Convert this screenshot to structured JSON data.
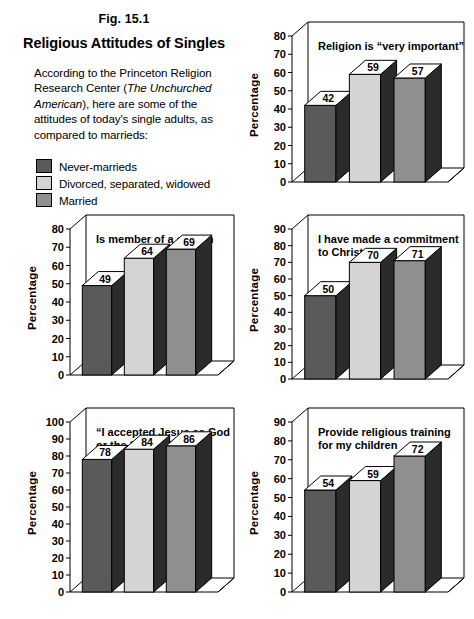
{
  "figure": {
    "fig_label": "Fig. 15.1",
    "title": "Religious Attitudes of Singles",
    "body_part1": "According to the Princeton Religion Research Center (",
    "body_italic1": "The Unchurched American",
    "body_part2": "), here are some of the attitudes of today's single adults, as compared to marrieds:"
  },
  "legend": {
    "items": [
      {
        "label": "Never-marrieds",
        "color": "#5a5a5a"
      },
      {
        "label": "Divorced, separated, widowed",
        "color": "#d4d4d4"
      },
      {
        "label": "Married",
        "color": "#8f8f8f"
      }
    ]
  },
  "axis_label": "Percentage",
  "colors": {
    "series_never_married": "#5a5a5a",
    "series_divorced": "#d4d4d4",
    "series_married": "#8f8f8f",
    "bar_side_shadow": "#2b2b2b",
    "bar_top_face": "#ffffff",
    "frame_line": "#000000",
    "background": "#ffffff"
  },
  "chart_data": [
    {
      "id": "religion-very-important",
      "type": "bar",
      "title": "Religion is \"very important\"",
      "title_lines": [
        "Religion is “very important”"
      ],
      "ylabel": "Percentage",
      "xlabel": "",
      "categories": [
        "Never-marrieds",
        "Divorced, separated, widowed",
        "Married"
      ],
      "values": [
        42,
        59,
        57
      ],
      "ylim": [
        0,
        80
      ],
      "yticks": [
        0,
        10,
        20,
        30,
        40,
        50,
        60,
        70,
        80
      ],
      "grid": false,
      "legend_position": "external"
    },
    {
      "id": "member-of-church",
      "type": "bar",
      "title": "Is member of a church",
      "title_lines": [
        "Is member of a church"
      ],
      "ylabel": "Percentage",
      "xlabel": "",
      "categories": [
        "Never-marrieds",
        "Divorced, separated, widowed",
        "Married"
      ],
      "values": [
        49,
        64,
        69
      ],
      "ylim": [
        0,
        80
      ],
      "yticks": [
        0,
        10,
        20,
        30,
        40,
        50,
        60,
        70,
        80
      ],
      "grid": false,
      "legend_position": "external"
    },
    {
      "id": "commitment-to-christ",
      "type": "bar",
      "title": "I have made a commitment to Christ",
      "title_lines": [
        "I have made a commitment",
        "to Christ"
      ],
      "ylabel": "Percentage",
      "xlabel": "",
      "categories": [
        "Never-marrieds",
        "Divorced, separated, widowed",
        "Married"
      ],
      "values": [
        50,
        70,
        71
      ],
      "ylim": [
        0,
        90
      ],
      "yticks": [
        0,
        10,
        20,
        30,
        40,
        50,
        60,
        70,
        80,
        90
      ],
      "grid": false,
      "legend_position": "external"
    },
    {
      "id": "accepted-jesus",
      "type": "bar",
      "title": "\"I accepted Jesus as God or the Son of God\"",
      "title_lines": [
        "“I accepted Jesus as God",
        "or the Son of God”"
      ],
      "ylabel": "Percentage",
      "xlabel": "",
      "categories": [
        "Never-marrieds",
        "Divorced, separated, widowed",
        "Married"
      ],
      "values": [
        78,
        84,
        86
      ],
      "ylim": [
        0,
        100
      ],
      "yticks": [
        0,
        10,
        20,
        30,
        40,
        50,
        60,
        70,
        80,
        90,
        100
      ],
      "grid": false,
      "legend_position": "external"
    },
    {
      "id": "religious-training",
      "type": "bar",
      "title": "Provide religious training for my children",
      "title_lines": [
        "Provide religious training",
        "for my children"
      ],
      "ylabel": "Percentage",
      "xlabel": "",
      "categories": [
        "Never-marrieds",
        "Divorced, separated, widowed",
        "Married"
      ],
      "values": [
        54,
        59,
        72
      ],
      "ylim": [
        0,
        90
      ],
      "yticks": [
        0,
        10,
        20,
        30,
        40,
        50,
        60,
        70,
        80,
        90
      ],
      "grid": false,
      "legend_position": "external"
    }
  ],
  "layout": {
    "panels": [
      {
        "chart_index": 0,
        "left": 246,
        "top": 12,
        "width": 222,
        "height": 186
      },
      {
        "chart_index": 1,
        "left": 24,
        "top": 205,
        "width": 214,
        "height": 186
      },
      {
        "chart_index": 2,
        "left": 246,
        "top": 205,
        "width": 222,
        "height": 190
      },
      {
        "chart_index": 3,
        "left": 24,
        "top": 398,
        "width": 214,
        "height": 210
      },
      {
        "chart_index": 4,
        "left": 246,
        "top": 398,
        "width": 222,
        "height": 210
      }
    ]
  }
}
